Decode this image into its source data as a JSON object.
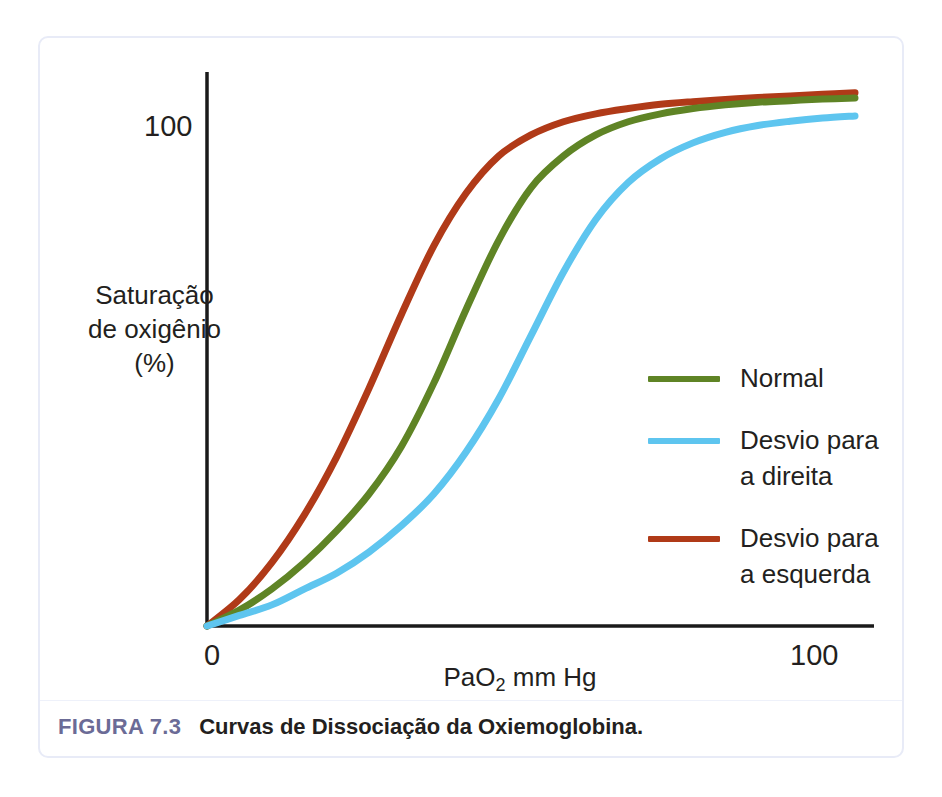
{
  "figure": {
    "caption_number": "FIGURA 7.3",
    "caption_text": "Curvas de Dissociação da Oxiemoglobina.",
    "frame_border_color": "#e8ebf7",
    "caption_number_color": "#6b6b96"
  },
  "chart_data": {
    "type": "line",
    "title": "Curvas de Dissociação da Oxiemoglobina.",
    "xlabel": "PaO2 mm Hg",
    "xlabel_display": "PaO",
    "xlabel_sub": "2",
    "xlabel_rest": " mm Hg",
    "ylabel_line1": "Saturação",
    "ylabel_line2": "de oxigênio",
    "ylabel_line3": "(%)",
    "ylabel": "Saturação de oxigênio (%)",
    "xlim": [
      0,
      115
    ],
    "ylim": [
      0,
      110
    ],
    "xticks": [
      "0",
      "100"
    ],
    "xtick_values": [
      0,
      100
    ],
    "yticks": [
      "100"
    ],
    "ytick_values": [
      100
    ],
    "grid": false,
    "legend_position": "right-center",
    "x": [
      0,
      5,
      10,
      15,
      20,
      25,
      30,
      35,
      40,
      45,
      50,
      55,
      60,
      65,
      70,
      75,
      80,
      85,
      90,
      95,
      100
    ],
    "series": [
      {
        "name": "Normal",
        "color": "#5f8425",
        "values": [
          0,
          3,
          7,
          12,
          18,
          25,
          34,
          46,
          60,
          73,
          83,
          89,
          93,
          95.5,
          97,
          98,
          98.7,
          99.2,
          99.5,
          99.8,
          100
        ]
      },
      {
        "name": "Desvio para a direita",
        "color": "#5ec5ef",
        "values": [
          0,
          2,
          4,
          7,
          10,
          14,
          19,
          25,
          33,
          43,
          55,
          67,
          77,
          84,
          88.5,
          91.5,
          93.5,
          94.8,
          95.6,
          96.2,
          96.6
        ]
      },
      {
        "name": "Desvio para a esquerda",
        "color": "#b03a18",
        "values": [
          0,
          5,
          12,
          21,
          32,
          45,
          59,
          72,
          82,
          89,
          93,
          95.5,
          97,
          98,
          98.8,
          99.3,
          99.7,
          100.1,
          100.4,
          100.7,
          101
        ]
      }
    ]
  },
  "legend": {
    "items": [
      {
        "label_line1": "Normal",
        "label_line2": "",
        "color": "#5f8425"
      },
      {
        "label_line1": "Desvio para",
        "label_line2": "a direita",
        "color": "#5ec5ef"
      },
      {
        "label_line1": "Desvio para",
        "label_line2": "a esquerda",
        "color": "#b03a18"
      }
    ]
  },
  "axes": {
    "y_tick_top": "100",
    "x_tick_origin": "0",
    "x_tick_max": "100",
    "axis_color": "#1a1a1a"
  }
}
